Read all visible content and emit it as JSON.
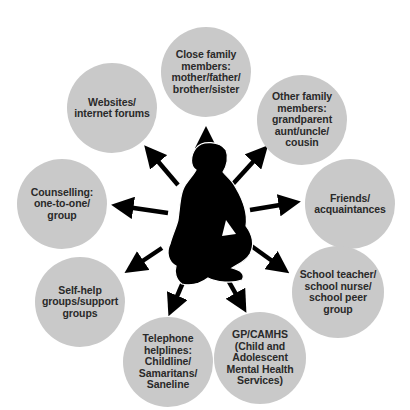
{
  "diagram": {
    "type": "hub-and-spoke",
    "center": {
      "label": "young-person-silhouette"
    },
    "colors": {
      "circle_fill": "#c9c9c9",
      "text": "#2a2a2a",
      "arrow": "#000000",
      "background": "#ffffff"
    },
    "nodes": [
      {
        "id": "close-family",
        "text": "Close family\nmembers:\nmother/father/\nbrother/sister",
        "cx": 206,
        "cy": 72,
        "r": 45
      },
      {
        "id": "other-family",
        "text": "Other family\nmembers:\ngrandparent\naunt/uncle/\ncousin",
        "cx": 302,
        "cy": 120,
        "r": 45
      },
      {
        "id": "friends",
        "text": "Friends/\nacquaintances",
        "cx": 350,
        "cy": 204,
        "r": 45
      },
      {
        "id": "school",
        "text": "School teacher/\nschool nurse/\nschool peer\ngroup",
        "cx": 338,
        "cy": 292,
        "r": 46
      },
      {
        "id": "gp-camhs",
        "text": "GP/CAMHS\n(Child and\nAdolescent\nMental Health\nServices)",
        "cx": 260,
        "cy": 358,
        "r": 46
      },
      {
        "id": "telephone",
        "text": "Telephone\nhelplines:\nChildline/\nSamaritans/\nSaneline",
        "cx": 168,
        "cy": 362,
        "r": 45
      },
      {
        "id": "self-help",
        "text": "Self-help\ngroups/support\ngroups",
        "cx": 80,
        "cy": 302,
        "r": 45
      },
      {
        "id": "counselling",
        "text": "Counselling:\none-to-one/\ngroup",
        "cx": 62,
        "cy": 204,
        "r": 45
      },
      {
        "id": "websites",
        "text": "Websites/\ninternet forums",
        "cx": 112,
        "cy": 108,
        "r": 45
      }
    ]
  }
}
